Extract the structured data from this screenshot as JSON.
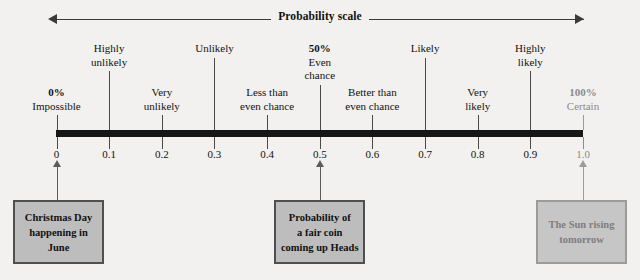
{
  "title": "Probability scale",
  "axis": {
    "min": 0,
    "max": 1,
    "ticks": [
      {
        "value": "0",
        "num": 0.0
      },
      {
        "value": "0.1",
        "num": 0.1
      },
      {
        "value": "0.2",
        "num": 0.2
      },
      {
        "value": "0.3",
        "num": 0.3
      },
      {
        "value": "0.4",
        "num": 0.4
      },
      {
        "value": "0.5",
        "num": 0.5
      },
      {
        "value": "0.6",
        "num": 0.6
      },
      {
        "value": "0.7",
        "num": 0.7
      },
      {
        "value": "0.8",
        "num": 0.8
      },
      {
        "value": "0.9",
        "num": 0.9
      },
      {
        "value": "1.0",
        "num": 1.0
      }
    ]
  },
  "descriptors": [
    {
      "percent": "0%",
      "line1": "Impossible",
      "line2": "",
      "at": 0.0
    },
    {
      "percent": "",
      "line1": "Highly",
      "line2": "unlikely",
      "at": 0.1
    },
    {
      "percent": "",
      "line1": "Very",
      "line2": "unlikely",
      "at": 0.2
    },
    {
      "percent": "",
      "line1": "Unlikely",
      "line2": "",
      "at": 0.3
    },
    {
      "percent": "",
      "line1": "Less than",
      "line2": "even chance",
      "at": 0.4
    },
    {
      "percent": "50%",
      "line1": "Even",
      "line2": "chance",
      "at": 0.5
    },
    {
      "percent": "",
      "line1": "Better than",
      "line2": "even chance",
      "at": 0.6
    },
    {
      "percent": "",
      "line1": "Likely",
      "line2": "",
      "at": 0.7
    },
    {
      "percent": "",
      "line1": "Very",
      "line2": "likely",
      "at": 0.8
    },
    {
      "percent": "",
      "line1": "Highly",
      "line2": "likely",
      "at": 0.9
    },
    {
      "percent": "100%",
      "line1": "Certain",
      "line2": "",
      "at": 1.0
    }
  ],
  "examples": [
    {
      "lines": [
        "Christmas Day",
        "happening in",
        "June"
      ],
      "at": 0.0
    },
    {
      "lines": [
        "Probability of",
        "a fair coin",
        "coming up Heads"
      ],
      "at": 0.5
    },
    {
      "lines": [
        "The Sun rising",
        "tomorrow"
      ],
      "at": 1.0
    }
  ],
  "colors": {
    "bar": "#171717",
    "text": "#111111",
    "muted": "#8a8a8a",
    "box_fill": "#bdbdbd",
    "box_border": "#4f4f4f",
    "background": "#f2f1ef"
  }
}
